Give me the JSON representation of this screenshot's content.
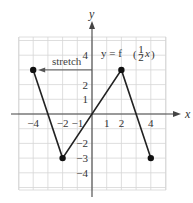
{
  "chart_data": {
    "type": "line",
    "title": "",
    "xlabel": "x",
    "ylabel": "y",
    "xlim": [
      -5,
      5
    ],
    "ylim": [
      -5,
      5
    ],
    "grid": true,
    "x_tick_labels": [
      "-4",
      "-2",
      "-1",
      "1",
      "2",
      "4"
    ],
    "x_ticks": [
      -4,
      -2,
      -1,
      1,
      2,
      4
    ],
    "y_tick_labels": [
      "4",
      "2",
      "1",
      "-2",
      "-3",
      "-4"
    ],
    "y_ticks": [
      4,
      2,
      1,
      -2,
      -3,
      -4
    ],
    "series": [
      {
        "name": "y = f(1/2 x)",
        "x": [
          -4,
          -2,
          2,
          4
        ],
        "y": [
          3,
          -3,
          3,
          -3
        ],
        "endpoints": [
          [
            -4,
            3
          ],
          [
            -2,
            -3
          ],
          [
            2,
            3
          ],
          [
            4,
            -3
          ]
        ]
      }
    ],
    "annotations": [
      {
        "text": "stretch",
        "type": "arrow",
        "from": [
          0,
          3
        ],
        "to": [
          -4,
          3
        ]
      },
      {
        "text": "y = f(½x)",
        "position": [
          2,
          4
        ]
      }
    ]
  },
  "labels": {
    "x_axis": "x",
    "y_axis": "y",
    "stretch": "stretch",
    "fn_prefix": "y = f",
    "fn_num": "1",
    "fn_den": "2",
    "fn_var": "x"
  }
}
